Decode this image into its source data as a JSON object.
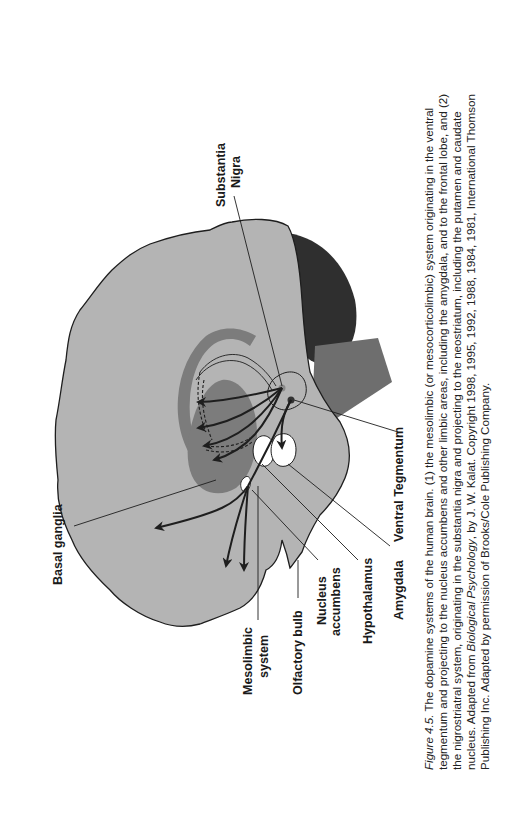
{
  "figure": {
    "number_label": "Figure 4.5.",
    "caption_lines": [
      {
        "pre": "",
        "italic": "Figure 4.5.",
        "post": " The dopamine systems of the human brain. (1) the mesolimbic (or mesocorticolimbic) system originating in the ventral"
      },
      {
        "pre": "tegmentum and projecting to the nucleus accumbens and other limbic areas, including the amygdala, and to the frontal lobe, and (2)",
        "italic": "",
        "post": ""
      },
      {
        "pre": "the nigrostriatral system, originating in the substantia nigra and projecting to the neostriatum, including the putamen and caudate",
        "italic": "",
        "post": ""
      },
      {
        "pre": "nucleus. Adapted from ",
        "italic": "Biological Psychology",
        "post": ", by J. W. Kalat. Copyright 1998, 1995, 1992, 1988, 1984, 1981, International Thomson"
      },
      {
        "pre": "Publishing Inc. Adapted by permission of Brooks/Cole Publishing Company.",
        "italic": "",
        "post": ""
      }
    ]
  },
  "labels": {
    "substantia_nigra_1": "Substantia",
    "substantia_nigra_2": "Nigra",
    "basal_ganglia": "Basal ganglia",
    "mesolimbic_1": "Mesolimbic",
    "mesolimbic_2": "system",
    "olfactory_bulb": "Olfactory bulb",
    "nucleus_accumbens_1": "Nucleus",
    "nucleus_accumbens_2": "accumbens",
    "hypothalamus": "Hypothalamus",
    "amygdala": "Amygdala",
    "ventral_tegmentum": "Ventral Tegmentum"
  },
  "colors": {
    "brain_fill": "#b4b4b4",
    "structure_dark": "#7c7c7c",
    "cerebellum": "#2f2f2f",
    "brainstem": "#6e6e6e",
    "outline": "#1e1e1e",
    "nuclei_white": "#ffffff"
  }
}
